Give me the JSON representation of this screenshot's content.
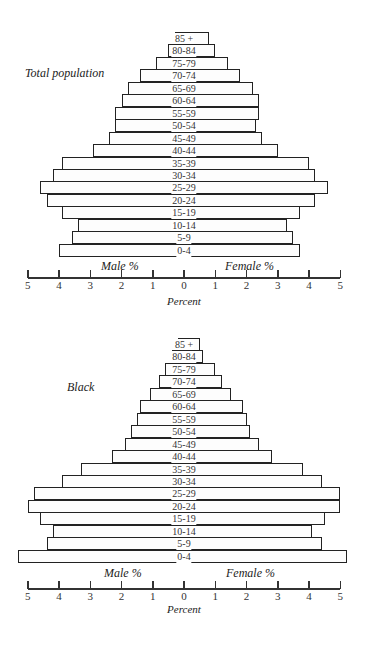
{
  "chart_data": [
    {
      "type": "bar",
      "subtype": "population-pyramid",
      "title": "Total population",
      "categories": [
        "0-4",
        "5-9",
        "10-14",
        "15-19",
        "20-24",
        "25-29",
        "30-34",
        "35-39",
        "40-44",
        "45-49",
        "50-54",
        "55-59",
        "60-64",
        "65-69",
        "70-74",
        "75-79",
        "80-84",
        "85 +"
      ],
      "series": [
        {
          "name": "Male %",
          "values": [
            4.0,
            3.6,
            3.4,
            3.9,
            4.4,
            4.6,
            4.2,
            3.9,
            2.9,
            2.4,
            2.2,
            2.2,
            2.0,
            1.8,
            1.4,
            0.9,
            0.5,
            0.3
          ]
        },
        {
          "name": "Female %",
          "values": [
            3.7,
            3.5,
            3.3,
            3.7,
            4.2,
            4.6,
            4.2,
            4.0,
            3.0,
            2.5,
            2.3,
            2.4,
            2.4,
            2.2,
            1.8,
            1.4,
            1.0,
            0.8
          ]
        }
      ],
      "xlabel": "Percent",
      "male_label": "Male %",
      "female_label": "Female %",
      "xlim": [
        -5,
        5
      ],
      "ticks": [
        "5",
        "4",
        "3",
        "2",
        "1",
        "0",
        "1",
        "2",
        "3",
        "4",
        "5"
      ],
      "grid": false
    },
    {
      "type": "bar",
      "subtype": "population-pyramid",
      "title": "Black",
      "categories": [
        "0-4",
        "5-9",
        "10-14",
        "15-19",
        "20-24",
        "25-29",
        "30-34",
        "35-39",
        "40-44",
        "45-49",
        "50-54",
        "55-59",
        "60-64",
        "65-69",
        "70-74",
        "75-79",
        "80-84",
        "85 +"
      ],
      "series": [
        {
          "name": "Male %",
          "values": [
            5.3,
            4.4,
            4.2,
            4.6,
            5.0,
            4.8,
            3.9,
            3.3,
            2.3,
            1.9,
            1.7,
            1.5,
            1.4,
            1.1,
            0.8,
            0.6,
            0.4,
            0.2
          ]
        },
        {
          "name": "Female %",
          "values": [
            5.2,
            4.4,
            4.1,
            4.5,
            5.0,
            5.0,
            4.4,
            3.8,
            2.8,
            2.4,
            2.1,
            2.0,
            1.9,
            1.5,
            1.2,
            1.0,
            0.6,
            0.5
          ]
        }
      ],
      "xlabel": "Percent",
      "male_label": "Male %",
      "female_label": "Female %",
      "xlim": [
        -5,
        5
      ],
      "ticks": [
        "5",
        "4",
        "3",
        "2",
        "1",
        "0",
        "1",
        "2",
        "3",
        "4",
        "5"
      ],
      "grid": false
    }
  ]
}
